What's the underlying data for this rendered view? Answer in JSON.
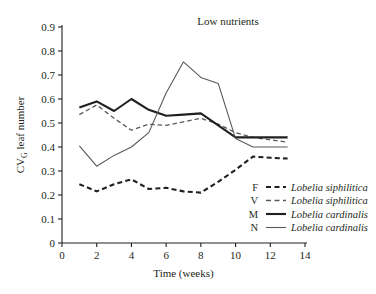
{
  "chart_data": {
    "type": "line",
    "title": "Low nutrients",
    "xlabel": "Time (weeks)",
    "ylabel": "CV",
    "ylabel_sub": "G",
    "ylabel_rest": " leaf number",
    "xlim": [
      0,
      14
    ],
    "ylim": [
      0,
      0.9
    ],
    "xticks": [
      "0",
      "2",
      "4",
      "6",
      "8",
      "10",
      "12",
      "14"
    ],
    "xtick_values": [
      0,
      2,
      4,
      6,
      8,
      10,
      12,
      14
    ],
    "yticks": [
      "0",
      "0.1",
      "0.2",
      "0.3",
      "0.4",
      "0.5",
      "0.6",
      "0.7",
      "0.8",
      "0.9"
    ],
    "ytick_values": [
      0,
      0.1,
      0.2,
      0.3,
      0.4,
      0.5,
      0.6,
      0.7,
      0.8,
      0.9
    ],
    "grid": false,
    "legend_position": "inside-bottom-right",
    "x": [
      1,
      2,
      3,
      4,
      5,
      6,
      7,
      8,
      9,
      10,
      11,
      12,
      13
    ],
    "series": [
      {
        "key": "F",
        "name": "Lobelia siphilitica",
        "style": "thick-dashed",
        "color": "#231f20",
        "values": [
          0.245,
          0.215,
          0.245,
          0.265,
          0.225,
          0.23,
          0.215,
          0.21,
          0.255,
          0.305,
          0.36,
          0.355,
          0.352
        ]
      },
      {
        "key": "V",
        "name": "Lobelia siphilitica",
        "style": "thin-dashed",
        "color": "#58595b",
        "values": [
          0.535,
          0.575,
          0.52,
          0.47,
          0.495,
          0.49,
          0.505,
          0.52,
          0.495,
          0.46,
          0.44,
          0.43,
          0.42
        ]
      },
      {
        "key": "M",
        "name": "Lobelia cardinalis",
        "style": "thick-solid",
        "color": "#231f20",
        "values": [
          0.565,
          0.59,
          0.55,
          0.6,
          0.555,
          0.53,
          0.535,
          0.54,
          0.49,
          0.44,
          0.44,
          0.44,
          0.44
        ]
      },
      {
        "key": "N",
        "name": "Lobelia cardinalis",
        "style": "thin-solid",
        "color": "#58595b",
        "values": [
          0.405,
          0.32,
          0.365,
          0.4,
          0.46,
          0.625,
          0.755,
          0.69,
          0.665,
          0.435,
          0.4,
          0.4,
          0.4
        ]
      }
    ]
  }
}
